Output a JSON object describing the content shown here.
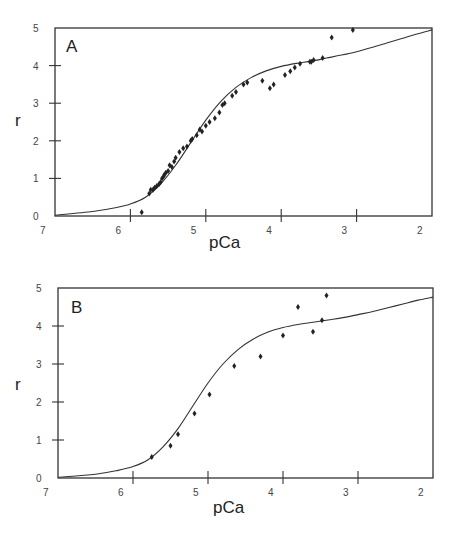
{
  "chart_data": [
    {
      "type": "scatter",
      "panel_label": "A",
      "title": "",
      "xlabel": "pCa",
      "ylabel": "r",
      "xlim": [
        7,
        2
      ],
      "ylim": [
        0,
        5
      ],
      "x_ticks": [
        "7",
        "6",
        "5",
        "4",
        "3",
        "2"
      ],
      "y_ticks": [
        "0",
        "1",
        "2",
        "3",
        "4",
        "5"
      ],
      "grid": false,
      "series": [
        {
          "name": "data",
          "type": "scatter",
          "x": [
            5.85,
            5.75,
            5.73,
            5.7,
            5.68,
            5.65,
            5.62,
            5.6,
            5.58,
            5.56,
            5.55,
            5.53,
            5.5,
            5.48,
            5.45,
            5.42,
            5.4,
            5.35,
            5.3,
            5.25,
            5.2,
            5.18,
            5.12,
            5.08,
            5.05,
            5.0,
            4.95,
            4.88,
            4.82,
            4.78,
            4.75,
            4.65,
            4.6,
            4.5,
            4.45,
            4.25,
            4.15,
            4.1,
            3.95,
            3.88,
            3.82,
            3.75,
            3.62,
            3.6,
            3.57,
            3.45,
            3.33,
            3.05
          ],
          "y": [
            0.1,
            0.6,
            0.7,
            0.7,
            0.75,
            0.8,
            0.85,
            0.9,
            1.0,
            1.05,
            1.1,
            1.15,
            1.2,
            1.35,
            1.3,
            1.45,
            1.55,
            1.7,
            1.8,
            1.85,
            2.0,
            2.05,
            2.15,
            2.3,
            2.25,
            2.4,
            2.5,
            2.6,
            2.75,
            2.95,
            3.0,
            3.2,
            3.3,
            3.5,
            3.55,
            3.6,
            3.4,
            3.5,
            3.75,
            3.85,
            3.95,
            4.05,
            4.1,
            4.1,
            4.15,
            4.2,
            4.75,
            4.95
          ]
        },
        {
          "name": "fit",
          "type": "line",
          "x": [
            7.0,
            6.5,
            6.2,
            6.0,
            5.8,
            5.6,
            5.4,
            5.2,
            5.0,
            4.8,
            4.6,
            4.4,
            4.2,
            4.0,
            3.8,
            3.6,
            3.4,
            3.2,
            3.0,
            2.8,
            2.6,
            2.4,
            2.2,
            2.0
          ],
          "y": [
            0.02,
            0.12,
            0.22,
            0.32,
            0.5,
            0.85,
            1.35,
            1.95,
            2.55,
            3.05,
            3.42,
            3.68,
            3.86,
            3.98,
            4.06,
            4.12,
            4.2,
            4.28,
            4.37,
            4.48,
            4.6,
            4.72,
            4.84,
            4.95
          ]
        }
      ]
    },
    {
      "type": "scatter",
      "panel_label": "B",
      "title": "",
      "xlabel": "pCa",
      "ylabel": "r",
      "xlim": [
        7,
        2
      ],
      "ylim": [
        0,
        5
      ],
      "x_ticks": [
        "7",
        "6",
        "5",
        "4",
        "3",
        "2"
      ],
      "y_ticks": [
        "0",
        "1",
        "2",
        "3",
        "4",
        "5"
      ],
      "grid": false,
      "series": [
        {
          "name": "data",
          "type": "scatter",
          "x": [
            5.75,
            5.5,
            5.4,
            5.18,
            4.98,
            4.65,
            4.3,
            4.0,
            3.8,
            3.6,
            3.48,
            3.42
          ],
          "y": [
            0.55,
            0.85,
            1.15,
            1.7,
            2.2,
            2.95,
            3.2,
            3.75,
            4.5,
            3.85,
            4.15,
            4.8
          ]
        },
        {
          "name": "fit",
          "type": "line",
          "x": [
            7.0,
            6.5,
            6.2,
            6.0,
            5.8,
            5.6,
            5.4,
            5.2,
            5.0,
            4.8,
            4.6,
            4.4,
            4.2,
            4.0,
            3.8,
            3.6,
            3.4,
            3.2,
            3.0,
            2.8,
            2.6,
            2.4,
            2.2,
            2.0
          ],
          "y": [
            0.02,
            0.1,
            0.2,
            0.3,
            0.48,
            0.82,
            1.3,
            1.9,
            2.5,
            3.0,
            3.38,
            3.65,
            3.84,
            3.96,
            4.04,
            4.1,
            4.16,
            4.22,
            4.3,
            4.38,
            4.48,
            4.58,
            4.68,
            4.76
          ]
        }
      ]
    }
  ],
  "panels": [
    {
      "label": "A",
      "xlabel": "pCa",
      "ylabel": "r",
      "x_ticks": [
        "7",
        "6",
        "5",
        "4",
        "3",
        "2"
      ],
      "y_ticks": [
        "0",
        "1",
        "2",
        "3",
        "4",
        "5"
      ]
    },
    {
      "label": "B",
      "xlabel": "pCa",
      "ylabel": "r",
      "x_ticks": [
        "7",
        "6",
        "5",
        "4",
        "3",
        "2"
      ],
      "y_ticks": [
        "0",
        "1",
        "2",
        "3",
        "4",
        "5"
      ]
    }
  ],
  "colors": {
    "ink": "#222222",
    "frame": "#333333",
    "background": "#ffffff"
  }
}
